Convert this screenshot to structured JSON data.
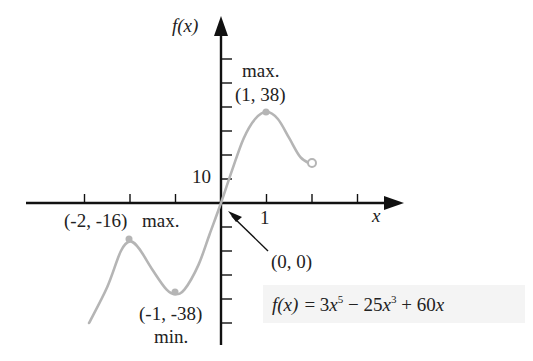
{
  "chart_data": {
    "type": "line",
    "title": "",
    "function": "f(x) = 3x^5 - 25x^3 + 60x",
    "xlabel": "x",
    "ylabel": "f(x)",
    "x_tick_label": "1",
    "y_tick_label": "10",
    "x_ticks": [
      -3,
      -2,
      -1,
      1,
      2,
      3
    ],
    "y_ticks": [
      -50,
      -40,
      -30,
      -20,
      -10,
      10,
      20,
      30,
      40,
      50,
      60
    ],
    "grid": false,
    "x": [
      -2.9,
      -2.5,
      -2.2,
      -2,
      -1.8,
      -1.5,
      -1.2,
      -1,
      -0.8,
      -0.5,
      -0.25,
      0,
      0.25,
      0.5,
      0.75,
      1,
      1.25,
      1.5,
      1.75,
      2
    ],
    "series": [
      {
        "name": "f(x)",
        "color": "#b5b5b5",
        "values": [
          -50,
          -35,
          -20,
          -16,
          -19,
          -28,
          -36,
          -38,
          -36,
          -26,
          -13,
          0,
          14,
          27,
          35,
          38,
          35,
          27,
          19,
          16
        ]
      }
    ],
    "annotations": [
      {
        "label_top": "max.",
        "label": "(1, 38)",
        "x": 1,
        "y": 38,
        "marker": "filled"
      },
      {
        "label": "(-2, -16)",
        "label_right": "max.",
        "x": -2,
        "y": -16,
        "marker": "filled"
      },
      {
        "label": "(-1, -38)",
        "label_bottom": "min.",
        "x": -1,
        "y": -38,
        "marker": "filled"
      },
      {
        "label": "(0, 0)",
        "x": 0,
        "y": 0,
        "marker": "arrow"
      },
      {
        "label": "",
        "x": 2,
        "y": 16,
        "marker": "open"
      }
    ]
  },
  "labels": {
    "y_axis": "f(x)",
    "x_axis": "x",
    "y_ten": "10",
    "x_one": "1",
    "max_right_word": "max.",
    "max_right_point": "(1, 38)",
    "max_left_point": "(-2, -16)",
    "max_left_word": "max.",
    "min_point": "(-1, -38)",
    "min_word": "min.",
    "origin_point": "(0, 0)",
    "formula_fx": "f(x)",
    "formula_eq": "= 3",
    "formula_x1": "x",
    "formula_exp1": "5",
    "formula_mid": " − 25",
    "formula_x2": "x",
    "formula_exp2": "3",
    "formula_end": " + 60",
    "formula_x3": "x"
  },
  "colors": {
    "axis": "#111111",
    "curve": "#b5b5b5",
    "text": "#222222",
    "formula_bg": "#f4f4f4"
  }
}
